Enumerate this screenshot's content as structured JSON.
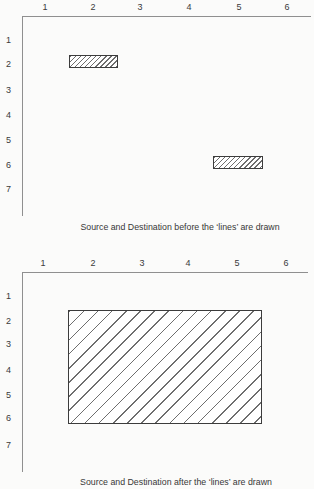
{
  "colors": {
    "paper": "#fbfbfa",
    "ink": "#3a3a3a",
    "axis": "#8f8f8f",
    "hatch": "#6e6e6e"
  },
  "fig1": {
    "x_labels": [
      "1",
      "2",
      "3",
      "4",
      "5",
      "6"
    ],
    "y_labels": [
      "1",
      "2",
      "3",
      "4",
      "5",
      "6",
      "7"
    ],
    "caption": "Source and Destination before the ‘lines’ are drawn"
  },
  "fig2": {
    "x_labels": [
      "1",
      "2",
      "3",
      "4",
      "5",
      "6"
    ],
    "y_labels": [
      "1",
      "2",
      "3",
      "4",
      "5",
      "6",
      "7"
    ],
    "caption": "Source and Destination after the ‘lines’ are drawn"
  },
  "diagram_data": {
    "type": "diagram",
    "figures": [
      {
        "caption": "Source and Destination before the ‘lines’ are drawn",
        "x_ticks": [
          1,
          2,
          3,
          4,
          5,
          6
        ],
        "y_ticks": [
          1,
          2,
          3,
          4,
          5,
          6,
          7
        ],
        "blocks": [
          {
            "label": "source",
            "x_span": [
              1.5,
              2.5
            ],
            "row": 2,
            "fill": "diagonal-hatch"
          },
          {
            "label": "destination",
            "x_span": [
              4.5,
              5.5
            ],
            "row": 6,
            "fill": "diagonal-hatch"
          }
        ]
      },
      {
        "caption": "Source and Destination after the ‘lines’ are drawn",
        "x_ticks": [
          1,
          2,
          3,
          4,
          5,
          6
        ],
        "y_ticks": [
          1,
          2,
          3,
          4,
          5,
          6,
          7
        ],
        "blocks": [
          {
            "label": "merged",
            "x_span": [
              1.5,
              5.5
            ],
            "y_span": [
              1.5,
              6
            ],
            "fill": "diagonal-hatch"
          }
        ]
      }
    ]
  }
}
